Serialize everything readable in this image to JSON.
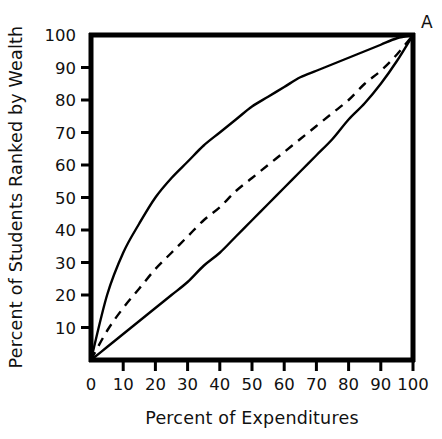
{
  "chart_data": {
    "type": "line",
    "title": "",
    "xlabel": "Percent of Expenditures",
    "ylabel": "Percent of Students Ranked by Wealth",
    "xlim": [
      0,
      100
    ],
    "ylim": [
      0,
      100
    ],
    "grid": false,
    "legend": "none",
    "xticks": [
      0,
      10,
      20,
      30,
      40,
      50,
      60,
      70,
      80,
      90,
      100
    ],
    "xtick_labels": [
      "0",
      "10",
      "20",
      "30",
      "40",
      "50",
      "60",
      "70",
      "80",
      "90",
      "100"
    ],
    "yticks": [
      10,
      20,
      30,
      40,
      50,
      60,
      70,
      80,
      90,
      100
    ],
    "ytick_labels": [
      "10",
      "20",
      "30",
      "40",
      "50",
      "60",
      "70",
      "80",
      "90",
      "100"
    ],
    "annotations": [
      {
        "text": "A",
        "x": 100,
        "y": 100,
        "position": "top-right-outside"
      }
    ],
    "x": [
      0,
      5,
      10,
      15,
      20,
      25,
      30,
      35,
      40,
      45,
      50,
      55,
      60,
      65,
      70,
      75,
      80,
      85,
      90,
      95,
      100
    ],
    "series": [
      {
        "name": "upper-curve",
        "style": "solid",
        "color": "#000000",
        "values": [
          0,
          20,
          33,
          42,
          50,
          56,
          61,
          66,
          70,
          74,
          78,
          81,
          84,
          87,
          89,
          91,
          93,
          95,
          97,
          99,
          100
        ]
      },
      {
        "name": "dashed-curve",
        "style": "dashed",
        "color": "#000000",
        "values": [
          0,
          9,
          16,
          22,
          28,
          33,
          38,
          43,
          47,
          52,
          56,
          60,
          64,
          68,
          72,
          76,
          80,
          85,
          89,
          94,
          100
        ]
      },
      {
        "name": "lower-curve",
        "style": "solid",
        "color": "#000000",
        "values": [
          0,
          4,
          8,
          12,
          16,
          20,
          24,
          29,
          33,
          38,
          43,
          48,
          53,
          58,
          63,
          68,
          74,
          79,
          85,
          92,
          100
        ]
      }
    ]
  }
}
